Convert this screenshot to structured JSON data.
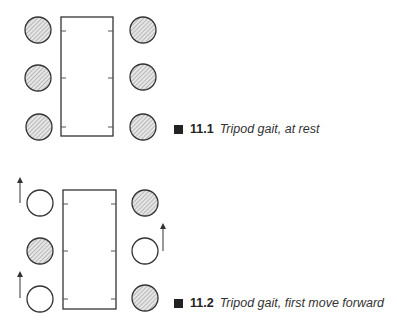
{
  "figures": [
    {
      "number": "11.1",
      "caption": "Tripod gait, at rest",
      "legs": {
        "left": [
          "planted",
          "planted",
          "planted"
        ],
        "right": [
          "planted",
          "planted",
          "planted"
        ]
      },
      "arrows": []
    },
    {
      "number": "11.2",
      "caption": "Tripod gait, first move forward",
      "legs": {
        "left": [
          "lifted",
          "planted",
          "lifted"
        ],
        "right": [
          "planted",
          "lifted",
          "planted"
        ]
      },
      "arrows": [
        "left-front",
        "right-middle",
        "left-rear"
      ]
    }
  ],
  "colors": {
    "stroke": "#333333",
    "hatch": "#999999",
    "fill": "#ffffff"
  }
}
